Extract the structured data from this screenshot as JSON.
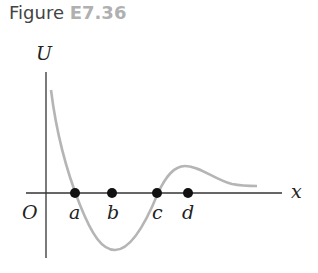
{
  "caption": {
    "prefix": "Figure",
    "number": "E7.36"
  },
  "axes": {
    "y_label": "U",
    "x_label": "x",
    "origin_label": "O"
  },
  "points": [
    {
      "label": "a",
      "x": 75
    },
    {
      "label": "b",
      "x": 112
    },
    {
      "label": "c",
      "x": 157
    },
    {
      "label": "d",
      "x": 188
    }
  ],
  "colors": {
    "curve": "#b5b5b5",
    "axis": "#333333",
    "point": "#111111"
  }
}
